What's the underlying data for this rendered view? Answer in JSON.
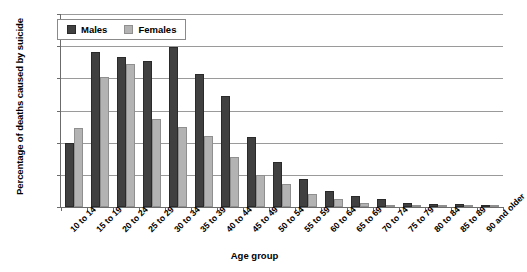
{
  "chart_data": {
    "type": "bar",
    "title": "",
    "xlabel": "Age group",
    "ylabel": "Percentage of deaths caused by suicide",
    "ylim": [
      0,
      30
    ],
    "ytick_labels": [
      "0%",
      "5%",
      "10%",
      "15%",
      "20%",
      "25%",
      "30%"
    ],
    "ytick_values": [
      0,
      5,
      10,
      15,
      20,
      25,
      30
    ],
    "grid": true,
    "legend_position": "top-left",
    "categories": [
      "10 to 14",
      "15 to 19",
      "20 to 24",
      "25 to 29",
      "30 to 34",
      "35 to 39",
      "40 to 44",
      "45 to 49",
      "50 to 54",
      "55 to 59",
      "60 to 64",
      "65 to 69",
      "70 to 74",
      "75 to 79",
      "80 to 84",
      "85 to 89",
      "90 and older"
    ],
    "series": [
      {
        "name": "Males",
        "color": "#404040",
        "values": [
          10.0,
          24.1,
          23.3,
          22.7,
          24.8,
          20.7,
          17.2,
          10.9,
          7.0,
          4.3,
          2.5,
          1.7,
          1.2,
          0.6,
          0.5,
          0.5,
          0.3
        ]
      },
      {
        "name": "Females",
        "color": "#b3b3b3",
        "values": [
          12.3,
          20.2,
          22.2,
          13.7,
          12.5,
          11.1,
          7.7,
          5.0,
          3.5,
          2.1,
          1.3,
          0.7,
          0.3,
          0.2,
          0.2,
          0.1,
          0.1
        ]
      }
    ]
  }
}
